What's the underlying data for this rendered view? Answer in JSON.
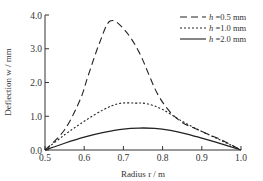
{
  "chart_data": {
    "type": "line",
    "title": "",
    "xlabel": "Radius r / m",
    "ylabel": "Deflection w / mm",
    "xlim": [
      0.5,
      1.0
    ],
    "ylim": [
      0.0,
      4.0
    ],
    "xticks": [
      "0.5",
      "0.6",
      "0.7",
      "0.8",
      "0.9",
      "1.0"
    ],
    "yticks": [
      "0.0",
      "1.0",
      "2.0",
      "3.0",
      "4.0"
    ],
    "grid": false,
    "legend_position": "upper right",
    "series": [
      {
        "name": "h =0.5 mm",
        "style": "dashed",
        "x": [
          0.5,
          0.55,
          0.59,
          0.61,
          0.64,
          0.666,
          0.7,
          0.74,
          0.79,
          0.84,
          0.9,
          0.95,
          1.0
        ],
        "y": [
          0.0,
          0.6,
          1.5,
          2.2,
          3.2,
          3.82,
          3.6,
          2.9,
          1.6,
          0.9,
          0.55,
          0.3,
          0.0
        ]
      },
      {
        "name": "h =1.0 mm",
        "style": "dotted",
        "x": [
          0.5,
          0.55,
          0.6,
          0.65,
          0.69,
          0.73,
          0.76,
          0.8,
          0.85,
          0.9,
          0.95,
          1.0
        ],
        "y": [
          0.0,
          0.45,
          0.85,
          1.2,
          1.38,
          1.39,
          1.37,
          1.2,
          0.85,
          0.55,
          0.28,
          0.0
        ]
      },
      {
        "name": "h =2.0 mm",
        "style": "solid",
        "x": [
          0.5,
          0.55,
          0.6,
          0.65,
          0.7,
          0.74,
          0.78,
          0.82,
          0.86,
          0.9,
          0.95,
          1.0
        ],
        "y": [
          0.0,
          0.2,
          0.38,
          0.52,
          0.62,
          0.65,
          0.64,
          0.58,
          0.48,
          0.35,
          0.18,
          0.0
        ]
      }
    ]
  },
  "legend": {
    "items": [
      {
        "label": "h =0.5 mm",
        "style": "dashed"
      },
      {
        "label": "h =1.0 mm",
        "style": "dotted"
      },
      {
        "label": "h =2.0 mm",
        "style": "solid"
      }
    ]
  },
  "axes": {
    "xlabel": "Radius r / m",
    "ylabel": "Deflection w / mm"
  },
  "colors": {
    "line": "#222222",
    "axis": "#333333"
  }
}
